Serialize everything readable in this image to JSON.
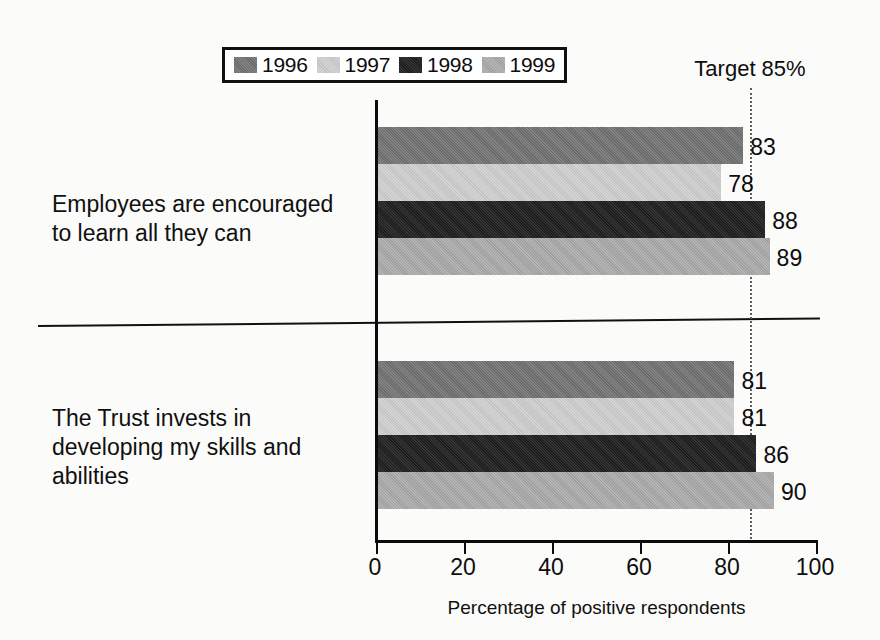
{
  "chart_data": {
    "type": "bar",
    "orientation": "horizontal",
    "title": "",
    "xlabel": "Percentage of positive respondents",
    "ylabel": "",
    "xlim": [
      0,
      100
    ],
    "xticks": [
      0,
      20,
      40,
      60,
      80,
      100
    ],
    "xtick_labels": [
      "0",
      "20",
      "40",
      "60",
      "80",
      "100"
    ],
    "grid": false,
    "legend_position": "top",
    "categories": [
      "Employees are encouraged to learn all they can",
      "The Trust invests in developing my skills and abilities"
    ],
    "series": [
      {
        "name": "1996",
        "color": "#6b6b6b",
        "values": [
          83,
          81
        ]
      },
      {
        "name": "1997",
        "color": "#c3c3c3",
        "values": [
          78,
          81
        ]
      },
      {
        "name": "1998",
        "color": "#1d1d1d",
        "values": [
          88,
          86
        ]
      },
      {
        "name": "1999",
        "color": "#a0a0a0",
        "values": [
          89,
          90
        ]
      }
    ],
    "annotations": [
      {
        "name": "target",
        "label": "Target 85%",
        "value": 85,
        "style": "dotted-vertical-line"
      }
    ]
  },
  "legend": {
    "entries": [
      {
        "label": "1996"
      },
      {
        "label": "1997"
      },
      {
        "label": "1998"
      },
      {
        "label": "1999"
      }
    ]
  },
  "axis": {
    "title": "Percentage of positive respondents",
    "ticks": [
      "0",
      "20",
      "40",
      "60",
      "80",
      "100"
    ]
  },
  "target": {
    "label": "Target 85%"
  },
  "categories": [
    {
      "label": "Employees are encouraged to learn all they can"
    },
    {
      "label": "The Trust invests in developing my skills and abilities"
    }
  ],
  "bar_values": {
    "group0": [
      "83",
      "78",
      "88",
      "89"
    ],
    "group1": [
      "81",
      "81",
      "86",
      "90"
    ]
  }
}
